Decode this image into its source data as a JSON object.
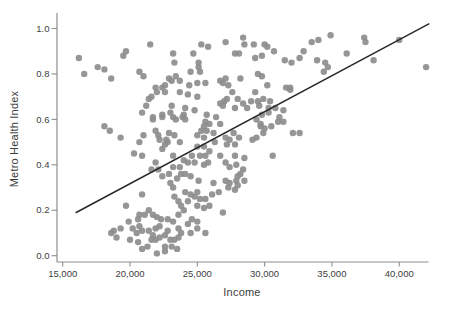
{
  "chart_data": {
    "type": "scatter",
    "title": "",
    "xlabel": "Income",
    "ylabel": "Metro Health Index",
    "xlim": [
      14600,
      42200
    ],
    "ylim": [
      0.0,
      1.0
    ],
    "grid": false,
    "legend": "none",
    "point_color": "#8d8d8d",
    "trend_color": "#2a2a2a",
    "axis_color": "#8e8e8e",
    "label_color": "#3d3d3d",
    "x_tick_values": [
      15000,
      20000,
      25000,
      30000,
      35000,
      40000
    ],
    "x_tick_labels": [
      "15,000",
      "20,000",
      "25,000",
      "30,000",
      "35,000",
      "40,000"
    ],
    "y_tick_values": [
      0.0,
      0.2,
      0.4,
      0.6,
      0.8,
      1.0
    ],
    "y_tick_labels": [
      "0.0",
      "0.2",
      "0.4",
      "0.6",
      "0.8",
      "1.0"
    ],
    "trendline": {
      "x1": 16000,
      "y1": 0.19,
      "x2": 42200,
      "y2": 1.02
    },
    "points": [
      [
        16200,
        0.87
      ],
      [
        16600,
        0.8
      ],
      [
        17600,
        0.83
      ],
      [
        18100,
        0.82
      ],
      [
        18600,
        0.78
      ],
      [
        19500,
        0.88
      ],
      [
        19700,
        0.9
      ],
      [
        20700,
        0.81
      ],
      [
        21500,
        0.93
      ],
      [
        22400,
        0.74
      ],
      [
        23200,
        0.89
      ],
      [
        23300,
        0.85
      ],
      [
        23100,
        0.77
      ],
      [
        22900,
        0.78
      ],
      [
        22000,
        0.72
      ],
      [
        22600,
        0.72
      ],
      [
        21400,
        0.69
      ],
      [
        23100,
        0.66
      ],
      [
        21700,
        0.6
      ],
      [
        22400,
        0.61
      ],
      [
        23000,
        0.63
      ],
      [
        23200,
        0.61
      ],
      [
        24000,
        0.62
      ],
      [
        24100,
        0.6
      ],
      [
        18100,
        0.57
      ],
      [
        18500,
        0.55
      ],
      [
        19300,
        0.52
      ],
      [
        22100,
        0.53
      ],
      [
        22700,
        0.51
      ],
      [
        21000,
        0.79
      ],
      [
        23400,
        0.79
      ],
      [
        23700,
        0.77
      ],
      [
        21900,
        0.74
      ],
      [
        22600,
        0.75
      ],
      [
        23700,
        0.72
      ],
      [
        21600,
        0.7
      ],
      [
        21200,
        0.66
      ],
      [
        20900,
        0.63
      ],
      [
        21700,
        0.61
      ],
      [
        22400,
        0.62
      ],
      [
        23400,
        0.6
      ],
      [
        23900,
        0.61
      ],
      [
        21900,
        0.55
      ],
      [
        22900,
        0.54
      ],
      [
        23300,
        0.53
      ],
      [
        22200,
        0.51
      ],
      [
        22800,
        0.5
      ],
      [
        23700,
        0.5
      ],
      [
        21000,
        0.53
      ],
      [
        20700,
        0.5
      ],
      [
        24700,
        0.89
      ],
      [
        25300,
        0.93
      ],
      [
        25800,
        0.92
      ],
      [
        25100,
        0.85
      ],
      [
        25100,
        0.83
      ],
      [
        24500,
        0.81
      ],
      [
        25200,
        0.81
      ],
      [
        24400,
        0.75
      ],
      [
        25000,
        0.76
      ],
      [
        25600,
        0.76
      ],
      [
        24300,
        0.71
      ],
      [
        25000,
        0.7
      ],
      [
        24100,
        0.65
      ],
      [
        24800,
        0.64
      ],
      [
        25700,
        0.62
      ],
      [
        25600,
        0.59
      ],
      [
        25900,
        0.58
      ],
      [
        25300,
        0.55
      ],
      [
        25700,
        0.55
      ],
      [
        26200,
        0.54
      ],
      [
        25000,
        0.53
      ],
      [
        25500,
        0.52
      ],
      [
        27100,
        0.94
      ],
      [
        28400,
        0.96
      ],
      [
        28500,
        0.93
      ],
      [
        27800,
        0.89
      ],
      [
        27100,
        0.78
      ],
      [
        26700,
        0.77
      ],
      [
        26900,
        0.76
      ],
      [
        27300,
        0.75
      ],
      [
        28100,
        0.89
      ],
      [
        29200,
        0.93
      ],
      [
        30000,
        0.93
      ],
      [
        30200,
        0.92
      ],
      [
        30700,
        0.9
      ],
      [
        29300,
        0.87
      ],
      [
        29800,
        0.88
      ],
      [
        29500,
        0.8
      ],
      [
        29800,
        0.79
      ],
      [
        30200,
        0.75
      ],
      [
        29300,
        0.72
      ],
      [
        28200,
        0.78
      ],
      [
        28000,
        0.69
      ],
      [
        27800,
        0.65
      ],
      [
        28700,
        0.65
      ],
      [
        29000,
        0.68
      ],
      [
        29500,
        0.68
      ],
      [
        29900,
        0.69
      ],
      [
        30400,
        0.68
      ],
      [
        29800,
        0.62
      ],
      [
        30300,
        0.63
      ],
      [
        29700,
        0.57
      ],
      [
        30000,
        0.56
      ],
      [
        30500,
        0.57
      ],
      [
        31000,
        0.59
      ],
      [
        31500,
        0.86
      ],
      [
        32000,
        0.85
      ],
      [
        32600,
        0.87
      ],
      [
        32900,
        0.9
      ],
      [
        33500,
        0.94
      ],
      [
        31600,
        0.74
      ],
      [
        31900,
        0.74
      ],
      [
        31400,
        0.64
      ],
      [
        27600,
        0.72
      ],
      [
        27000,
        0.68
      ],
      [
        27200,
        0.69
      ],
      [
        26700,
        0.67
      ],
      [
        28400,
        0.67
      ],
      [
        29600,
        0.66
      ],
      [
        30300,
        0.65
      ],
      [
        29400,
        0.6
      ],
      [
        29700,
        0.58
      ],
      [
        29900,
        0.54
      ],
      [
        29400,
        0.52
      ],
      [
        29100,
        0.51
      ],
      [
        31100,
        0.61
      ],
      [
        31400,
        0.59
      ],
      [
        27700,
        0.54
      ],
      [
        28100,
        0.52
      ],
      [
        27400,
        0.51
      ],
      [
        27100,
        0.52
      ],
      [
        26700,
        0.58
      ],
      [
        32100,
        0.54
      ],
      [
        32600,
        0.54
      ],
      [
        31900,
        0.73
      ],
      [
        30800,
        0.65
      ],
      [
        26900,
        0.66
      ],
      [
        26400,
        0.61
      ],
      [
        25500,
        0.57
      ],
      [
        34000,
        0.95
      ],
      [
        34900,
        0.97
      ],
      [
        33900,
        0.86
      ],
      [
        34500,
        0.85
      ],
      [
        34700,
        0.83
      ],
      [
        34400,
        0.81
      ],
      [
        36100,
        0.89
      ],
      [
        37400,
        0.96
      ],
      [
        37500,
        0.94
      ],
      [
        38100,
        0.86
      ],
      [
        40000,
        0.95
      ],
      [
        42000,
        0.83
      ],
      [
        20300,
        0.45
      ],
      [
        20900,
        0.44
      ],
      [
        22400,
        0.47
      ],
      [
        22600,
        0.49
      ],
      [
        23200,
        0.44
      ],
      [
        21900,
        0.41
      ],
      [
        21600,
        0.38
      ],
      [
        22100,
        0.38
      ],
      [
        22400,
        0.35
      ],
      [
        22900,
        0.36
      ],
      [
        23200,
        0.39
      ],
      [
        23700,
        0.39
      ],
      [
        24000,
        0.42
      ],
      [
        23800,
        0.36
      ],
      [
        23500,
        0.34
      ],
      [
        23000,
        0.32
      ],
      [
        23200,
        0.3
      ],
      [
        20900,
        0.27
      ],
      [
        19700,
        0.22
      ],
      [
        19900,
        0.15
      ],
      [
        18800,
        0.11
      ],
      [
        19300,
        0.12
      ],
      [
        20200,
        0.12
      ],
      [
        20700,
        0.13
      ],
      [
        20500,
        0.1
      ],
      [
        20900,
        0.11
      ],
      [
        20000,
        0.07
      ],
      [
        20600,
        0.06
      ],
      [
        20900,
        0.03
      ],
      [
        21300,
        0.04
      ],
      [
        21600,
        0.07
      ],
      [
        21900,
        0.07
      ],
      [
        22200,
        0.08
      ],
      [
        21700,
        0.09
      ],
      [
        21400,
        0.11
      ],
      [
        21900,
        0.12
      ],
      [
        22200,
        0.13
      ],
      [
        22300,
        0.16
      ],
      [
        22000,
        0.17
      ],
      [
        21700,
        0.18
      ],
      [
        21400,
        0.2
      ],
      [
        21100,
        0.18
      ],
      [
        20700,
        0.18
      ],
      [
        20600,
        0.16
      ],
      [
        23300,
        0.26
      ],
      [
        23600,
        0.24
      ],
      [
        23800,
        0.22
      ],
      [
        24000,
        0.2
      ],
      [
        23600,
        0.18
      ],
      [
        22800,
        0.16
      ],
      [
        23200,
        0.15
      ],
      [
        23600,
        0.12
      ],
      [
        22800,
        0.11
      ],
      [
        22600,
        0.09
      ],
      [
        23000,
        0.07
      ],
      [
        23300,
        0.07
      ],
      [
        23600,
        0.08
      ],
      [
        23800,
        0.1
      ],
      [
        22600,
        0.04
      ],
      [
        23100,
        0.04
      ],
      [
        23500,
        0.03
      ],
      [
        22000,
        0.01
      ],
      [
        22600,
        0.02
      ],
      [
        19000,
        0.08
      ],
      [
        18600,
        0.1
      ],
      [
        25000,
        0.48
      ],
      [
        25500,
        0.48
      ],
      [
        26300,
        0.5
      ],
      [
        27200,
        0.49
      ],
      [
        27800,
        0.49
      ],
      [
        24600,
        0.44
      ],
      [
        25200,
        0.44
      ],
      [
        25600,
        0.44
      ],
      [
        25900,
        0.46
      ],
      [
        26700,
        0.44
      ],
      [
        27800,
        0.44
      ],
      [
        28500,
        0.43
      ],
      [
        24300,
        0.41
      ],
      [
        24800,
        0.41
      ],
      [
        25500,
        0.4
      ],
      [
        25800,
        0.41
      ],
      [
        27100,
        0.41
      ],
      [
        27400,
        0.39
      ],
      [
        27900,
        0.4
      ],
      [
        28400,
        0.38
      ],
      [
        24100,
        0.36
      ],
      [
        24500,
        0.35
      ],
      [
        25100,
        0.33
      ],
      [
        26200,
        0.32
      ],
      [
        27100,
        0.33
      ],
      [
        27400,
        0.32
      ],
      [
        27900,
        0.33
      ],
      [
        28000,
        0.35
      ],
      [
        27300,
        0.3
      ],
      [
        27800,
        0.29
      ],
      [
        28000,
        0.31
      ],
      [
        24100,
        0.28
      ],
      [
        24500,
        0.27
      ],
      [
        25000,
        0.28
      ],
      [
        24800,
        0.26
      ],
      [
        24300,
        0.24
      ],
      [
        25200,
        0.25
      ],
      [
        25600,
        0.25
      ],
      [
        26100,
        0.27
      ],
      [
        26600,
        0.28
      ],
      [
        25000,
        0.22
      ],
      [
        25500,
        0.21
      ],
      [
        25900,
        0.22
      ],
      [
        26900,
        0.19
      ],
      [
        24600,
        0.16
      ],
      [
        25000,
        0.15
      ],
      [
        24300,
        0.14
      ],
      [
        25000,
        0.12
      ],
      [
        24500,
        0.1
      ],
      [
        25600,
        0.1
      ],
      [
        30600,
        0.44
      ],
      [
        28200,
        0.36
      ],
      [
        28500,
        0.33
      ]
    ]
  }
}
